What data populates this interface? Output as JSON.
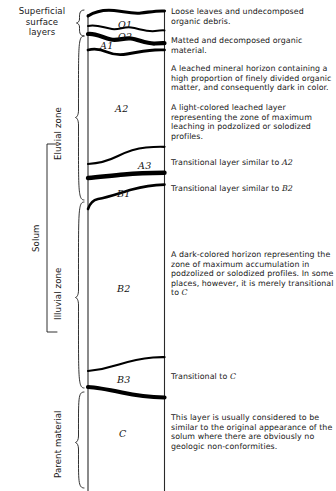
{
  "figure": {
    "type": "soil-profile-diagram",
    "title_visible": false
  },
  "zones": [
    {
      "key": "superficial",
      "label": "Superficial\nsurface\nlayers",
      "label_flat": "Superficial surface layers",
      "orientation": "horizontal"
    },
    {
      "key": "eluvial",
      "label": "Eluvial zone",
      "orientation": "vertical"
    },
    {
      "key": "solum",
      "label": "Solum",
      "orientation": "vertical"
    },
    {
      "key": "illuvial",
      "label": "Illuvial zone",
      "orientation": "vertical"
    },
    {
      "key": "parent",
      "label": "Parent material",
      "orientation": "vertical"
    }
  ],
  "zone_text": {
    "superficial_l1": "Superficial",
    "superficial_l2": "surface",
    "superficial_l3": "layers",
    "eluvial": "Eluvial zone",
    "solum": "Solum",
    "illuvial": "Illuvial zone",
    "parent": "Parent material"
  },
  "horizons": [
    {
      "code": "O1",
      "desc": "Loose leaves and undecomposed organic debris."
    },
    {
      "code": "O2",
      "desc": "Matted and decomposed organic material."
    },
    {
      "code": "A1",
      "desc": "A leached mineral horizon containing a high proportion of finely divided organic matter, and consequently dark in color."
    },
    {
      "code": "A2",
      "desc": "A light-colored leached layer representing the zone of maximum leaching in podzolized or solodized profiles."
    },
    {
      "code": "A3",
      "desc": "Transitional layer similar to A2"
    },
    {
      "code": "B1",
      "desc": "Transitional layer similar to B2"
    },
    {
      "code": "B2",
      "desc": "A dark-colored horizon representing the zone of maximum accumulation in podzolized or solodized profiles. In some places, however, it is merely transitional to C"
    },
    {
      "code": "B3",
      "desc": "Transitional to C"
    },
    {
      "code": "C",
      "desc": "This layer is usually considered to be similar to the original appearance of the solum where there are obviously no geologic non-conformities."
    }
  ],
  "descriptions": {
    "o1": "Loose leaves and undecomposed organic debris.",
    "o2": "Matted and decomposed organic material.",
    "a1": "A leached mineral horizon containing a high proportion of finely divided organic matter, and consequently dark in color.",
    "a2": "A light-colored leached layer representing the zone of maximum leaching in podzolized or solodized profiles.",
    "a3_pre": "Transitional layer similar to ",
    "a3_ref": "A2",
    "b1_pre": "Transitional layer similar to ",
    "b1_ref": "B2",
    "b2_pre": "A dark-colored horizon representing the zone of maximum accumulation in podzolized or solodized profiles. In some places, however, it is merely transitional to ",
    "b2_ref": "C",
    "b3_pre": "Transitional to ",
    "b3_ref": "C",
    "c": "This layer is usually considered to be similar to the original appearance of the solum where there are obviously no geologic non-conformities."
  },
  "horizon_codes": {
    "o1": "O1",
    "o2": "O2",
    "a1": "A1",
    "a2": "A2",
    "a3": "A3",
    "b1": "B1",
    "b2": "B2",
    "b3": "B3",
    "c": "C"
  },
  "colors": {
    "ink": "#111111",
    "text": "#1a1a1a",
    "background": "#ffffff",
    "horizon_line": "#000000",
    "column_border": "#2a2a2a"
  }
}
